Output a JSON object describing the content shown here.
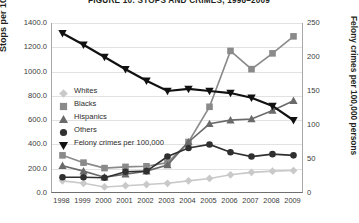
{
  "title": "FIGURE 10: STOPS AND CRIMES, 1998–2009",
  "axes": {
    "left_label": "Stops per 100,000 persons",
    "right_label": "Felony crimes per 100,000 persons",
    "left_ticks": [
      "1400.0",
      "1200.0",
      "1000.0",
      "800.0",
      "600.0",
      "400.0",
      "200.0",
      "0.0"
    ],
    "right_ticks": [
      "250",
      "200",
      "150",
      "100",
      "50",
      "0"
    ],
    "x_ticks": [
      "1998",
      "1999",
      "2000",
      "2001",
      "2002",
      "2003",
      "2004",
      "2005",
      "2006",
      "2007",
      "2008",
      "2009"
    ]
  },
  "legend": [
    {
      "label": "Whites",
      "marker": "diamond-marker",
      "color": "#c9c9c9"
    },
    {
      "label": "Blacks",
      "marker": "square-marker",
      "color": "#8a8a8a"
    },
    {
      "label": "Hispanics",
      "marker": "triangle-marker",
      "color": "#6a6a6a"
    },
    {
      "label": "Others",
      "marker": "circle-marker",
      "color": "#303030"
    },
    {
      "label": "Felony crimes per 100,000",
      "marker": "inverted-triangle-marker",
      "color": "#111111"
    }
  ],
  "chart_data": {
    "type": "line",
    "title": "FIGURE 10: STOPS AND CRIMES, 1998–2009",
    "xlabel": "",
    "ylabel": "Stops per 100,000 persons",
    "y2label": "Felony crimes per 100,000 persons",
    "x": [
      1998,
      1999,
      2000,
      2001,
      2002,
      2003,
      2004,
      2005,
      2006,
      2007,
      2008,
      2009
    ],
    "ylim": [
      0,
      1400
    ],
    "y2lim": [
      0,
      250
    ],
    "grid": true,
    "legend_position": "left-middle",
    "series": [
      {
        "name": "Whites",
        "axis": "left",
        "marker": "diamond",
        "color": "#c9c9c9",
        "values": [
          100,
          80,
          50,
          60,
          70,
          80,
          100,
          120,
          150,
          170,
          180,
          185
        ]
      },
      {
        "name": "Blacks",
        "axis": "left",
        "marker": "square",
        "color": "#8a8a8a",
        "values": [
          310,
          250,
          205,
          215,
          220,
          250,
          420,
          710,
          1170,
          1020,
          1150,
          1290
        ]
      },
      {
        "name": "Hispanics",
        "axis": "left",
        "marker": "triangle",
        "color": "#6a6a6a",
        "values": [
          225,
          180,
          130,
          155,
          180,
          230,
          420,
          570,
          600,
          610,
          680,
          760
        ]
      },
      {
        "name": "Others",
        "axis": "left",
        "marker": "circle",
        "color": "#303030",
        "values": [
          130,
          130,
          125,
          175,
          180,
          300,
          370,
          400,
          335,
          300,
          320,
          310
        ]
      },
      {
        "name": "Felony crimes per 100,000",
        "axis": "right",
        "marker": "inverted-triangle",
        "color": "#111111",
        "values": [
          235,
          218,
          200,
          182,
          165,
          150,
          153,
          150,
          147,
          140,
          128,
          107
        ]
      }
    ]
  }
}
